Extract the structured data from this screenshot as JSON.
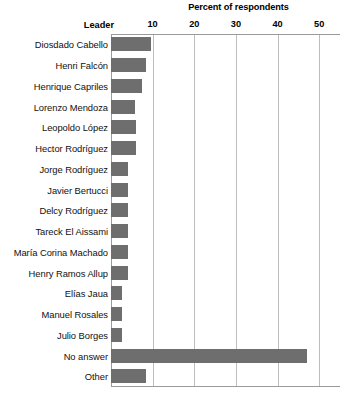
{
  "chart_data": {
    "type": "bar",
    "orientation": "horizontal",
    "title": "Percent of respondents",
    "xlabel": "Percent of respondents",
    "ylabel": "Leader",
    "category_header": "Leader",
    "xlim": [
      0,
      55
    ],
    "xticks": [
      10,
      20,
      30,
      40,
      50
    ],
    "xtick_labels": [
      "10",
      "20",
      "30",
      "40",
      "50"
    ],
    "grid": "vertical",
    "legend": "none",
    "bar_color": "#6e6e6e",
    "gridline_color": "#bdbdbd",
    "axis_color": "#9a9a9a",
    "categories": [
      "Diosdado Cabello",
      "Henri Falcón",
      "Henrique Capriles",
      "Lorenzo Mendoza",
      "Leopoldo López",
      "Hector Rodríguez",
      "Jorge Rodríguez",
      "Javier Bertucci",
      "Delcy Rodríguez",
      "Tareck El Aissami",
      "María Corina Machado",
      "Henry Ramos Allup",
      "Elías Jaua",
      "Manuel Rosales",
      "Julio Borges",
      "No answer",
      "Other"
    ],
    "values": [
      9.6,
      8.5,
      7.5,
      5.7,
      5.9,
      5.9,
      4.1,
      4.1,
      4.1,
      4.1,
      4.1,
      4.1,
      2.7,
      2.7,
      2.7,
      47.0,
      8.4
    ]
  }
}
